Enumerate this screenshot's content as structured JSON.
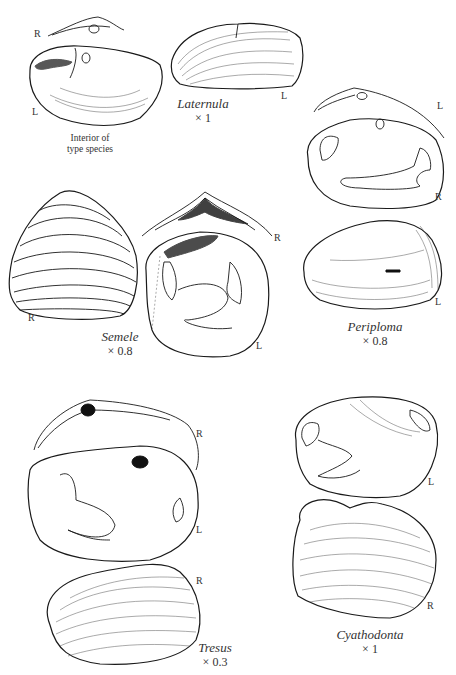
{
  "figure": {
    "type": "scientific-illustration",
    "specimens": [
      {
        "genus": "Laternula",
        "scale": "× 1",
        "views": [
          {
            "label": "R",
            "desc": "hinge view"
          },
          {
            "label": "L",
            "desc": "interior of type species"
          },
          {
            "label": "L",
            "desc": "exterior"
          }
        ],
        "caption": "Interior of type species"
      },
      {
        "genus": "Periploma",
        "scale": "× 0.8",
        "views": [
          {
            "label": "L",
            "desc": "hinge"
          },
          {
            "label": "R",
            "desc": "interior"
          },
          {
            "label": "L",
            "desc": "exterior"
          }
        ]
      },
      {
        "genus": "Semele",
        "scale": "× 0.8",
        "views": [
          {
            "label": "R",
            "desc": "exterior"
          },
          {
            "label": "R",
            "desc": "hinge"
          },
          {
            "label": "L",
            "desc": "interior"
          }
        ]
      },
      {
        "genus": "Tresus",
        "scale": "× 0.3",
        "views": [
          {
            "label": "R",
            "desc": "hinge"
          },
          {
            "label": "L",
            "desc": "interior"
          },
          {
            "label": "R",
            "desc": "exterior"
          }
        ]
      },
      {
        "genus": "Cyathodonta",
        "scale": "× 1",
        "views": [
          {
            "label": "L",
            "desc": "interior"
          },
          {
            "label": "R",
            "desc": "exterior"
          }
        ]
      }
    ],
    "labels": {
      "lat_r": "R",
      "lat_l": "L",
      "lat_ext_l": "L",
      "lat_caption_1": "Interior of",
      "lat_caption_2": "type species",
      "lat_name": "Laternula",
      "lat_scale": "× 1",
      "per_l1": "L",
      "per_r": "R",
      "per_l2": "L",
      "per_name": "Periploma",
      "per_scale": "× 0.8",
      "sem_r1": "R",
      "sem_r2": "R",
      "sem_l": "L",
      "sem_name": "Semele",
      "sem_scale": "× 0.8",
      "tre_r1": "R",
      "tre_l": "L",
      "tre_r2": "R",
      "tre_name": "Tresus",
      "tre_scale": "× 0.3",
      "cya_l": "L",
      "cya_r": "R",
      "cya_name": "Cyathodonta",
      "cya_scale": "× 1"
    }
  }
}
